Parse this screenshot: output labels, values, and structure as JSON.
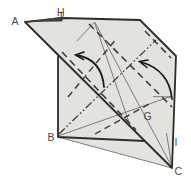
{
  "diagram": {
    "kind": "origami-fold-step",
    "labels": {
      "a": "A",
      "h": "H",
      "b": "B",
      "g": "G",
      "i": "I",
      "c": "C"
    },
    "line_legend": {
      "dashed": "valley-fold",
      "dash_dot_dot": "mountain-fold",
      "thin_solid": "existing-crease",
      "thick_solid": "paper-edge",
      "curved_arrow": "fold-direction"
    },
    "colors": {
      "background": "#ffffff",
      "paper": "#e4e2df",
      "outline": "#2e2c29",
      "crease": "#6a6762",
      "fold": "#3a3834",
      "mountain": "#3a3834",
      "arrow": "#1d1c1a",
      "flap_dark": "#45423c",
      "label": "#4b4945"
    }
  }
}
